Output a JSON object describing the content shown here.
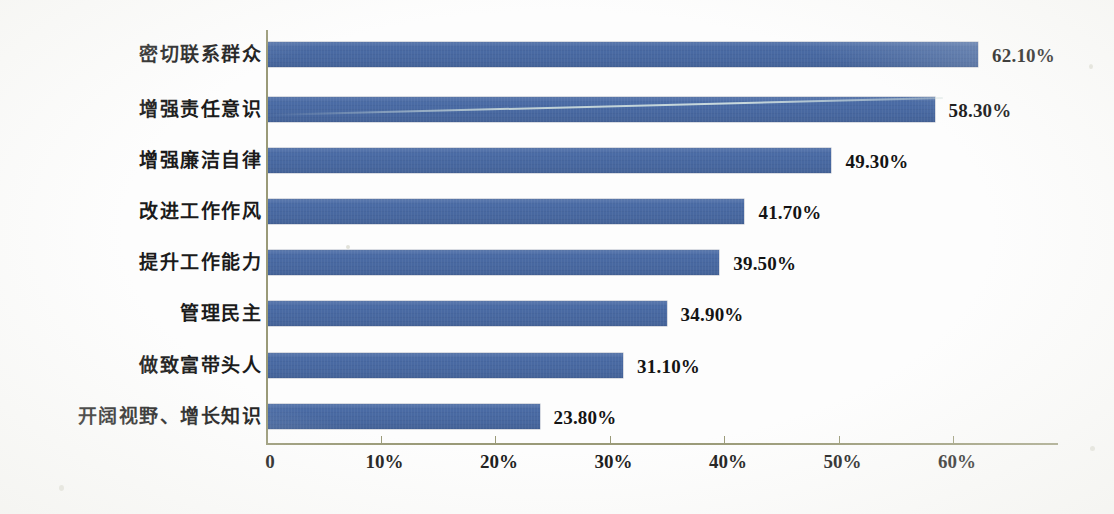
{
  "chart_data": {
    "type": "bar",
    "orientation": "horizontal",
    "title": "",
    "subtitle": "",
    "xlabel": "",
    "ylabel": "",
    "categories": [
      "密切联系群众",
      "增强责任意识",
      "增强廉洁自律",
      "改进工作作风",
      "提升工作能力",
      "管理民主",
      "做致富带头人",
      "开阔视野、增长知识"
    ],
    "values": [
      62.1,
      58.3,
      49.3,
      41.7,
      39.5,
      34.9,
      31.1,
      23.8
    ],
    "value_labels": [
      "62.10%",
      "58.30%",
      "49.30%",
      "41.70%",
      "39.50%",
      "34.90%",
      "31.10%",
      "23.80%"
    ],
    "xlim": [
      0,
      69.2
    ],
    "x_ticks": [
      0,
      10,
      20,
      30,
      40,
      50,
      60
    ],
    "x_tick_labels": [
      "0",
      "10%",
      "20%",
      "30%",
      "40%",
      "50%",
      "60%"
    ],
    "grid": false,
    "legend": false,
    "legend_position": "none",
    "series": [
      {
        "name": "",
        "values": [
          62.1,
          58.3,
          49.3,
          41.7,
          39.5,
          34.9,
          31.1,
          23.8
        ]
      }
    ],
    "colors": {
      "bar": "#4a6ba5",
      "axis": "#9a9a78",
      "text": "#141414",
      "background": "#fdfdfd"
    }
  }
}
